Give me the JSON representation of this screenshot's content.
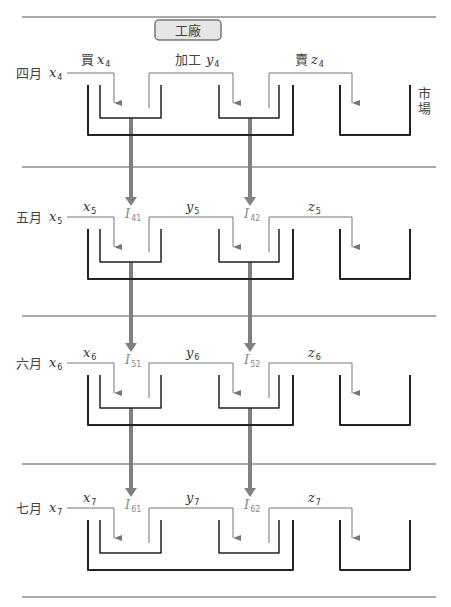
{
  "title": "工廠",
  "market_label": [
    "市",
    "場"
  ],
  "header_labels": {
    "buy": "買",
    "process": "加工",
    "sell": "賣"
  },
  "months": [
    {
      "name": "四月",
      "index": "4",
      "x": "x",
      "y": "y",
      "z": "z",
      "inv1": null,
      "inv2": null
    },
    {
      "name": "五月",
      "index": "5",
      "x": "x",
      "y": "y",
      "z": "z",
      "inv1": "41",
      "inv2": "42"
    },
    {
      "name": "六月",
      "index": "6",
      "x": "x",
      "y": "y",
      "z": "z",
      "inv1": "51",
      "inv2": "52"
    },
    {
      "name": "七月",
      "index": "7",
      "x": "x",
      "y": "y",
      "z": "z",
      "inv1": "61",
      "inv2": "62"
    }
  ],
  "inventory_symbol": "I",
  "colors": {
    "separator": "#555555",
    "bracket": "#222222",
    "flow": "#777777",
    "thick_arrow": "#808080",
    "title_box_fill": "#e6e6e6",
    "title_box_stroke": "#777777"
  }
}
